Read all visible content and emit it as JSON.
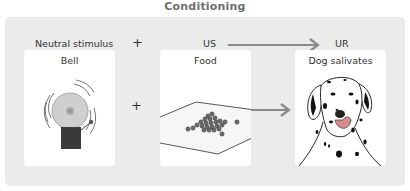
{
  "title": "Conditioning",
  "header": {
    "neutral_stimulus": "Neutral stimulus",
    "plus": "+",
    "us": "US",
    "ur": "UR"
  },
  "cards": [
    {
      "label": "Bell",
      "icon": "bell-icon"
    },
    {
      "label": "Food",
      "icon": "food-bowl-icon"
    },
    {
      "label": "Dog salivates",
      "icon": "dog-icon"
    }
  ],
  "between": {
    "plus": "+"
  },
  "colors": {
    "panel": "#ebebeb",
    "card": "#ffffff",
    "arrow": "#8a8a8a",
    "title": "#6e6e6e",
    "text": "#333333",
    "saliva": "#d98a8a"
  }
}
